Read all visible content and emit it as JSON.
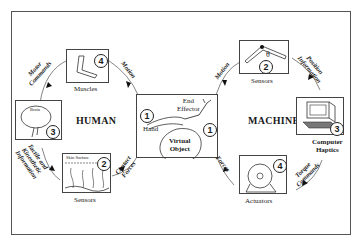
{
  "diagram": {
    "groups": {
      "human": "HUMAN",
      "machine": "MACHINE"
    },
    "center": {
      "number": "1",
      "number_right": "1",
      "end_effector": "End\nEffector",
      "hand": "Hand",
      "virtual_object": "Virtual\nObject"
    },
    "human_nodes": [
      {
        "id": "muscles",
        "label": "Muscles",
        "number": "4"
      },
      {
        "id": "brain",
        "label": "",
        "inner_label": "Brain",
        "number": "3"
      },
      {
        "id": "human-sensors",
        "label": "Sensors",
        "inner_label": "Skin Surface",
        "number": "2"
      }
    ],
    "machine_nodes": [
      {
        "id": "machine-sensors",
        "label": "Sensors",
        "symbol": "θ",
        "number": "2"
      },
      {
        "id": "computer",
        "label": "Computer\nHaptics",
        "number": "3"
      },
      {
        "id": "actuators",
        "label": "Actuators",
        "number": "4"
      }
    ],
    "edges": {
      "motor_commands": "Motor\nCommands",
      "human_motion": "Motion",
      "contact_forces": "Contact\nForces",
      "tactile_info": "Tactile and\nKinesthetic\nInformation",
      "machine_motion": "Motion",
      "position_info": "Position\nInformation",
      "torque_commands": "Torque\nCommands",
      "forces": "Forces"
    }
  }
}
